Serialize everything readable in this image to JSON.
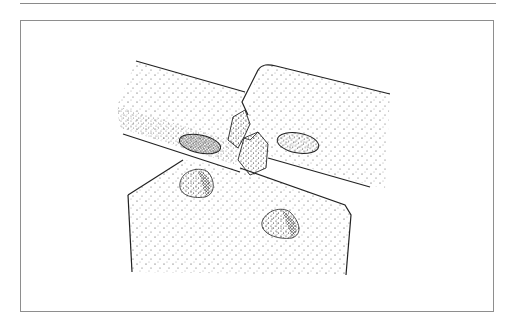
{
  "figure": {
    "ink_color": "#222222",
    "frame_color": "#8e8e8e",
    "background": "#ffffff"
  }
}
